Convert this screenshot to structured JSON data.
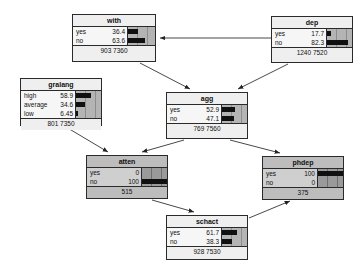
{
  "diagram": {
    "type": "bayesian-belief-network",
    "title": "",
    "colors": {
      "node_fill": "#efefef",
      "node_fill_shaded": "#bdbdbd",
      "bar_background": "#b4b4b4",
      "bar_fill": "#101010",
      "border": "#2a2a2a",
      "edge": "#333333"
    },
    "nodes": [
      {
        "id": "with",
        "title": "with",
        "shaded": false,
        "x": 72,
        "y": 14,
        "w": 84,
        "h": 48,
        "states": [
          {
            "label": "yes",
            "value": "36.4",
            "pct": 36.4
          },
          {
            "label": "no",
            "value": "63.6",
            "pct": 63.6
          }
        ],
        "footer": "903 7360"
      },
      {
        "id": "dep",
        "title": "dep",
        "shaded": false,
        "x": 271,
        "y": 16,
        "w": 82,
        "h": 47,
        "states": [
          {
            "label": "yes",
            "value": "17.7",
            "pct": 17.7
          },
          {
            "label": "no",
            "value": "82.3",
            "pct": 82.3
          }
        ],
        "footer": "1240 7520"
      },
      {
        "id": "gralang",
        "title": "gralang",
        "shaded": false,
        "x": 20,
        "y": 78,
        "w": 82,
        "h": 48,
        "states": [
          {
            "label": "high",
            "value": "58.9",
            "pct": 58.9
          },
          {
            "label": "average",
            "value": "34.6",
            "pct": 34.6
          },
          {
            "label": "low",
            "value": "6.45",
            "pct": 6.45
          }
        ],
        "footer": "801 7350"
      },
      {
        "id": "agg",
        "title": "agg",
        "shaded": false,
        "x": 166,
        "y": 92,
        "w": 82,
        "h": 47,
        "states": [
          {
            "label": "yes",
            "value": "52.9",
            "pct": 52.9
          },
          {
            "label": "no",
            "value": "47.1",
            "pct": 47.1
          }
        ],
        "footer": "769 7560"
      },
      {
        "id": "atten",
        "title": "atten",
        "shaded": true,
        "x": 86,
        "y": 155,
        "w": 82,
        "h": 44,
        "states": [
          {
            "label": "yes",
            "value": "0",
            "pct": 0
          },
          {
            "label": "no",
            "value": "100",
            "pct": 100
          }
        ],
        "footer": "515"
      },
      {
        "id": "phdep",
        "title": "phdep",
        "shaded": true,
        "x": 262,
        "y": 156,
        "w": 82,
        "h": 44,
        "states": [
          {
            "label": "yes",
            "value": "100",
            "pct": 100
          },
          {
            "label": "no",
            "value": "0",
            "pct": 0
          }
        ],
        "footer": "375"
      },
      {
        "id": "schact",
        "title": "schact",
        "shaded": false,
        "x": 166,
        "y": 215,
        "w": 82,
        "h": 45,
        "states": [
          {
            "label": "yes",
            "value": "61.7",
            "pct": 61.7
          },
          {
            "label": "no",
            "value": "38.3",
            "pct": 38.3
          }
        ],
        "footer": "928 7530"
      }
    ],
    "edges": [
      {
        "from": "dep",
        "to": "with",
        "x1": 276,
        "y1": 38,
        "x2": 160,
        "y2": 38
      },
      {
        "from": "with",
        "to": "agg",
        "x1": 140,
        "y1": 63,
        "x2": 190,
        "y2": 89
      },
      {
        "from": "dep",
        "to": "agg",
        "x1": 288,
        "y1": 64,
        "x2": 238,
        "y2": 89
      },
      {
        "from": "gralang",
        "to": "atten",
        "x1": 66,
        "y1": 127,
        "x2": 108,
        "y2": 152
      },
      {
        "from": "agg",
        "to": "atten",
        "x1": 184,
        "y1": 140,
        "x2": 142,
        "y2": 152
      },
      {
        "from": "agg",
        "to": "phdep",
        "x1": 230,
        "y1": 140,
        "x2": 280,
        "y2": 153
      },
      {
        "from": "atten",
        "to": "schact",
        "x1": 152,
        "y1": 200,
        "x2": 194,
        "y2": 212
      },
      {
        "from": "schact",
        "to": "phdep",
        "x1": 249,
        "y1": 218,
        "x2": 290,
        "y2": 201
      }
    ]
  }
}
